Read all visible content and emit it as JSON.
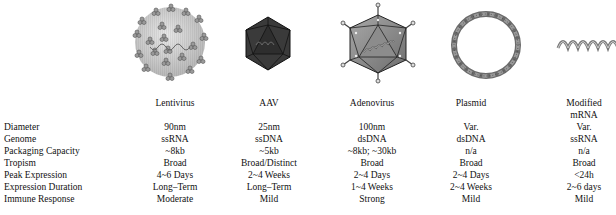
{
  "vectors": [
    {
      "name": "Lentivirus",
      "icon": "lentivirus-particle-icon",
      "center_x": 175
    },
    {
      "name": "AAV",
      "icon": "aav-icosahedron-icon",
      "center_x": 269
    },
    {
      "name": "Adenovirus",
      "icon": "adenovirus-capsid-icon",
      "center_x": 372
    },
    {
      "name": "Plasmid",
      "icon": "plasmid-ring-icon",
      "center_x": 471
    },
    {
      "name": "Modified mRNA",
      "name_line1": "Modified",
      "name_line2": "mRNA",
      "icon": "mrna-strand-icon",
      "center_x": 584
    }
  ],
  "rows": [
    {
      "label": "Diameter",
      "values": [
        "90nm",
        "25nm",
        "100nm",
        "Var.",
        "Var."
      ]
    },
    {
      "label": "Genome",
      "values": [
        "ssRNA",
        "ssDNA",
        "dsDNA",
        "dsDNA",
        "ssRNA"
      ]
    },
    {
      "label": "Packaging Capacity",
      "values": [
        "~8kb",
        "~5kb",
        "~8kb; ~30kb",
        "n/a",
        "n/a"
      ]
    },
    {
      "label": "Tropism",
      "values": [
        "Broad",
        "Broad/Distinct",
        "Broad",
        "Broad",
        "Broad"
      ]
    },
    {
      "label": "Peak Expression",
      "values": [
        "4~6 Days",
        "2~4 Weeks",
        "2~4 Days",
        "2~4 Days",
        "<24h"
      ]
    },
    {
      "label": "Expression Duration",
      "values": [
        "Long–Term",
        "Long–Term",
        "1~4 Weeks",
        "2~4 Weeks",
        "2~6 days"
      ]
    },
    {
      "label": "Immune Response",
      "values": [
        "Moderate",
        "Mild",
        "Strong",
        "Mild",
        "Mild"
      ]
    }
  ],
  "colors": {
    "lentivirus_fill": "#cfcfcf",
    "aav_fill": "#3a3a3a",
    "adenovirus_fill": "#8a8a8a",
    "plasmid_stroke": "#6a6a6a",
    "mrna_stroke": "#7a7a7a"
  }
}
